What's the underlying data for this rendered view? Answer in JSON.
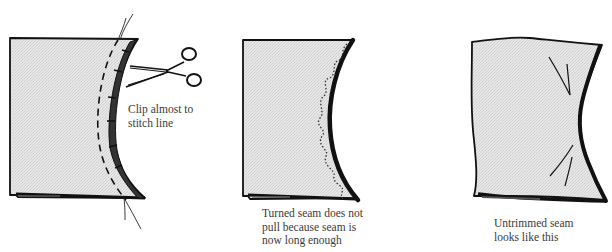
{
  "figure": {
    "panels": [
      {
        "id": "clip",
        "caption_lines": [
          "Clip almost to",
          "stitch line"
        ],
        "elements": [
          "fabric-piece",
          "concave-curved-seam",
          "dashed-stitch-line",
          "clip-marks",
          "scissors",
          "thread-ends"
        ]
      },
      {
        "id": "turned",
        "caption_lines": [
          "Turned seam does not",
          "pull because seam is",
          "now long enough"
        ],
        "elements": [
          "fabric-piece",
          "turned-curved-edge",
          "spread-clipped-seam-allowance"
        ]
      },
      {
        "id": "untrimmed",
        "caption_lines": [
          "Untrimmed seam",
          "looks like this"
        ],
        "elements": [
          "fabric-piece",
          "puckered-curved-edge",
          "pull-lines"
        ]
      }
    ],
    "colors": {
      "ink": "#111111",
      "fabric": "#e4e4e4",
      "text": "#3a3a3a"
    }
  },
  "captions": {
    "clip": "Clip almost to\nstitch line",
    "turned": "Turned seam does not\npull because seam is\nnow long enough",
    "untrimmed": "Untrimmed seam\nlooks like this"
  }
}
